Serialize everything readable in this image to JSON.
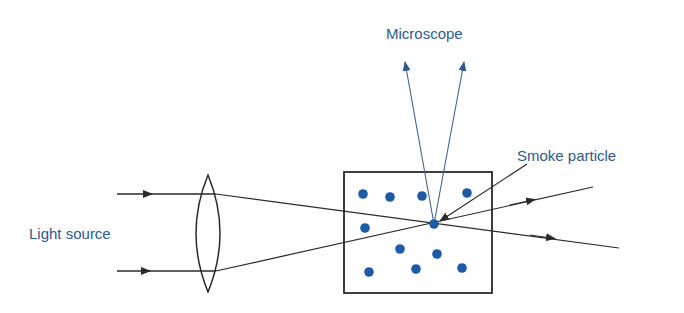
{
  "labels": {
    "microscope": "Microscope",
    "smoke_particle": "Smoke particle",
    "light_source": "Light source"
  },
  "colors": {
    "label": "#2e5a8c",
    "line": "#2a2a2a",
    "particle": "#1f5aa6",
    "scatter_ray": "#3c6496"
  },
  "particles": [
    [
      363,
      194
    ],
    [
      390,
      197
    ],
    [
      422,
      196
    ],
    [
      467,
      193
    ],
    [
      365,
      228
    ],
    [
      434,
      224
    ],
    [
      400,
      249
    ],
    [
      437,
      254
    ],
    [
      369,
      272
    ],
    [
      416,
      269
    ],
    [
      462,
      268
    ]
  ]
}
